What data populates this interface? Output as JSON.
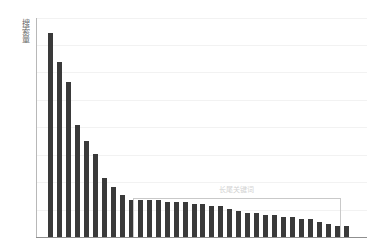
{
  "chart_data": {
    "type": "bar",
    "title": "",
    "subtitle": "",
    "xlabel": "",
    "ylabel": "搜索量",
    "grid": true,
    "grid_orientation": "horizontal",
    "legend": false,
    "legend_position": "none",
    "bar_color": "#3a3a3a",
    "axis_color": "#8f8f8f",
    "gridline_color": "#f2f2f2",
    "xlim": [
      0,
      34
    ],
    "ylim": [
      0,
      100
    ],
    "categories": [
      "1",
      "2",
      "3",
      "4",
      "5",
      "6",
      "7",
      "8",
      "9",
      "10",
      "11",
      "12",
      "13",
      "14",
      "15",
      "16",
      "17",
      "18",
      "19",
      "20",
      "21",
      "22",
      "23",
      "24",
      "25",
      "26",
      "27",
      "28",
      "29",
      "30",
      "31",
      "32",
      "33",
      "34"
    ],
    "values": [
      93,
      80,
      71,
      51,
      44,
      38,
      27,
      23,
      19,
      17,
      17,
      17,
      17,
      16,
      16,
      16,
      15,
      15,
      14,
      14,
      13,
      12,
      11,
      11,
      10,
      10,
      9,
      9,
      8,
      8,
      7,
      6,
      5,
      5
    ],
    "annotations": [
      {
        "name": "long-tail-region",
        "text": "长尾关键词",
        "start_index": 10,
        "end_index": 34,
        "box": true
      }
    ]
  },
  "axis": {
    "y_label": "搜索量"
  },
  "annotation": {
    "long_tail_label": "长尾关键词"
  }
}
